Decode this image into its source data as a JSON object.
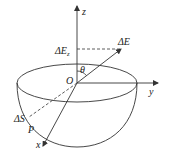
{
  "diagram": {
    "type": "hemisphere-coordinate-diagram",
    "labels": {
      "z_axis": "z",
      "y_axis": "y",
      "x_axis": "x",
      "origin": "O",
      "angle": "θ",
      "vector": "ΔE",
      "vector_component_main": "ΔE",
      "vector_component_sub": "z",
      "area_element": "ΔS",
      "point": "P"
    },
    "colors": {
      "stroke": "#333333",
      "background": "#ffffff"
    }
  }
}
